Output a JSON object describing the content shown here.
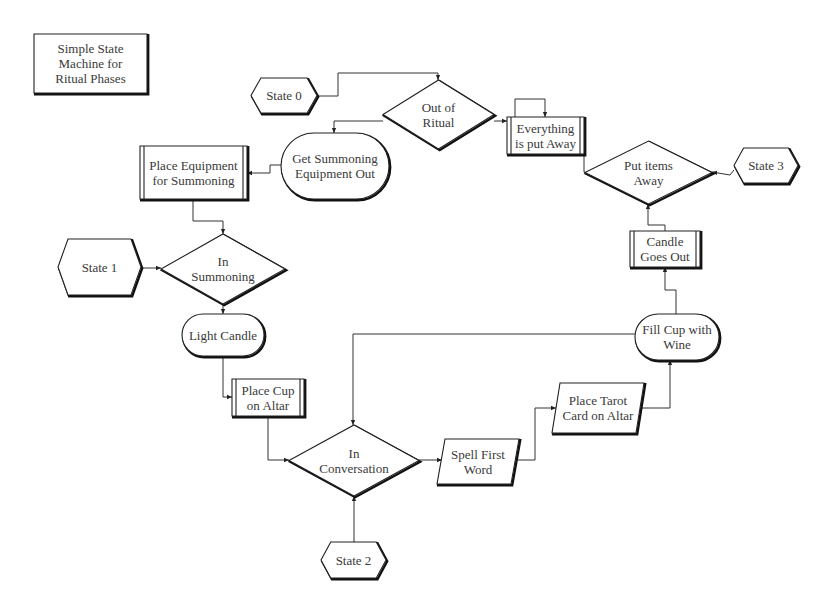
{
  "title": "Simple State\nMachine for\nRitual Phases",
  "nodes": [
    {
      "id": "title",
      "type": "box",
      "label": "Simple State\nMachine for\nRitual Phases",
      "x": 34,
      "y": 34,
      "w": 113,
      "h": 59
    },
    {
      "id": "state0",
      "type": "hexagon",
      "label": "State 0",
      "x": 251,
      "y": 78,
      "w": 66,
      "h": 35
    },
    {
      "id": "out_of_ritual",
      "type": "diamond",
      "label": "Out of\nRitual",
      "x": 383,
      "y": 80,
      "w": 111,
      "h": 69
    },
    {
      "id": "everything_put_away",
      "type": "process",
      "label": "Everything\nis put Away",
      "x": 507,
      "y": 117,
      "w": 77,
      "h": 37
    },
    {
      "id": "get_summoning",
      "type": "terminal",
      "label": "Get Summoning\nEquipment Out",
      "x": 281,
      "y": 133,
      "w": 108,
      "h": 66
    },
    {
      "id": "place_equipment",
      "type": "process",
      "label": "Place Equipment\nfor Summoning",
      "x": 140,
      "y": 146,
      "w": 107,
      "h": 53
    },
    {
      "id": "put_items_away",
      "type": "diamond",
      "label": "Put items\nAway",
      "x": 585,
      "y": 141,
      "w": 127,
      "h": 63
    },
    {
      "id": "state3",
      "type": "hexagon",
      "label": "State 3",
      "x": 734,
      "y": 148,
      "w": 64,
      "h": 35
    },
    {
      "id": "candle_goes_out",
      "type": "process",
      "label": "Candle\nGoes Out",
      "x": 630,
      "y": 231,
      "w": 70,
      "h": 36
    },
    {
      "id": "state1",
      "type": "hexagon",
      "label": "State 1",
      "x": 58,
      "y": 239,
      "w": 83,
      "h": 56
    },
    {
      "id": "in_summoning",
      "type": "diamond",
      "label": "In\nSummoning",
      "x": 161,
      "y": 234,
      "w": 124,
      "h": 70
    },
    {
      "id": "light_candle",
      "type": "terminal",
      "label": "Light Candle",
      "x": 182,
      "y": 314,
      "w": 82,
      "h": 42
    },
    {
      "id": "fill_cup",
      "type": "terminal",
      "label": "Fill Cup with\nWine",
      "x": 635,
      "y": 314,
      "w": 84,
      "h": 46
    },
    {
      "id": "place_cup",
      "type": "process",
      "label": "Place Cup\non Altar",
      "x": 232,
      "y": 379,
      "w": 72,
      "h": 37
    },
    {
      "id": "place_tarot",
      "type": "parallelogram",
      "label": "Place Tarot\nCard on Altar",
      "x": 552,
      "y": 383,
      "w": 92,
      "h": 50
    },
    {
      "id": "in_conversation",
      "type": "diamond",
      "label": "In\nConversation",
      "x": 289,
      "y": 425,
      "w": 130,
      "h": 71
    },
    {
      "id": "spell_first_word",
      "type": "parallelogram",
      "label": "Spell First\nWord",
      "x": 437,
      "y": 439,
      "w": 82,
      "h": 45
    },
    {
      "id": "state2",
      "type": "hexagon",
      "label": "State 2",
      "x": 321,
      "y": 542,
      "w": 65,
      "h": 36
    }
  ],
  "edges": [
    {
      "from": "state0",
      "to": "out_of_ritual",
      "points": [
        [
          317,
          96
        ],
        [
          338,
          96
        ],
        [
          338,
          73
        ],
        [
          438,
          73
        ],
        [
          438,
          80
        ]
      ]
    },
    {
      "from": "out_of_ritual",
      "to": "get_summoning",
      "points": [
        [
          383,
          121
        ],
        [
          334,
          121
        ],
        [
          334,
          133
        ]
      ]
    },
    {
      "from": "get_summoning",
      "to": "place_equipment",
      "points": [
        [
          281,
          165
        ],
        [
          270,
          165
        ],
        [
          270,
          173
        ],
        [
          247,
          173
        ]
      ]
    },
    {
      "from": "place_equipment",
      "to": "in_summoning",
      "points": [
        [
          193,
          199
        ],
        [
          193,
          221
        ],
        [
          223,
          221
        ],
        [
          223,
          234
        ]
      ]
    },
    {
      "from": "state1",
      "to": "in_summoning",
      "points": [
        [
          141,
          268
        ],
        [
          161,
          268
        ]
      ]
    },
    {
      "from": "in_summoning",
      "to": "light_candle",
      "points": [
        [
          223,
          304
        ],
        [
          223,
          314
        ]
      ]
    },
    {
      "from": "light_candle",
      "to": "place_cup",
      "points": [
        [
          223,
          356
        ],
        [
          223,
          397
        ],
        [
          232,
          397
        ]
      ]
    },
    {
      "from": "place_cup",
      "to": "in_conversation",
      "points": [
        [
          268,
          416
        ],
        [
          268,
          460
        ],
        [
          289,
          460
        ]
      ]
    },
    {
      "from": "state2",
      "to": "in_conversation",
      "points": [
        [
          354,
          542
        ],
        [
          354,
          496
        ]
      ]
    },
    {
      "from": "in_conversation",
      "to": "spell_first_word",
      "points": [
        [
          419,
          460
        ],
        [
          442,
          460
        ]
      ]
    },
    {
      "from": "spell_first_word",
      "to": "place_tarot",
      "points": [
        [
          517,
          460
        ],
        [
          535,
          460
        ],
        [
          535,
          408
        ],
        [
          556,
          408
        ]
      ]
    },
    {
      "from": "place_tarot",
      "to": "fill_cup",
      "points": [
        [
          640,
          408
        ],
        [
          670,
          408
        ],
        [
          670,
          360
        ]
      ]
    },
    {
      "from": "fill_cup",
      "to": "in_conversation",
      "points": [
        [
          635,
          334
        ],
        [
          353,
          334
        ],
        [
          353,
          425
        ]
      ]
    },
    {
      "from": "fill_cup",
      "to": "candle_goes_out",
      "points": [
        [
          676,
          314
        ],
        [
          676,
          290
        ],
        [
          665,
          290
        ],
        [
          665,
          267
        ]
      ]
    },
    {
      "from": "candle_goes_out",
      "to": "put_items_away",
      "points": [
        [
          665,
          231
        ],
        [
          665,
          225
        ],
        [
          648,
          225
        ],
        [
          648,
          204
        ]
      ]
    },
    {
      "from": "state3",
      "to": "put_items_away",
      "points": [
        [
          734,
          170
        ],
        [
          730,
          175
        ],
        [
          712,
          172
        ]
      ]
    },
    {
      "from": "put_items_away",
      "to": "everything_put_away",
      "points": [
        [
          585,
          172
        ],
        [
          584,
          172
        ],
        [
          584,
          135
        ]
      ]
    },
    {
      "from": "everything_put_away",
      "to": "everything_put_away",
      "points": [
        [
          515,
          117
        ],
        [
          515,
          99
        ],
        [
          545,
          99
        ],
        [
          545,
          117
        ]
      ]
    },
    {
      "from": "out_of_ritual",
      "to": "everything_put_away",
      "points": [
        [
          494,
          121
        ],
        [
          507,
          121
        ]
      ]
    }
  ],
  "colors": {
    "stroke": "#222222",
    "text": "#3a3a3a",
    "background": "#ffffff"
  }
}
